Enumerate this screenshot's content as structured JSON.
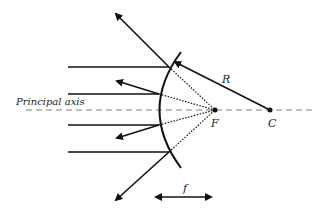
{
  "diagram": {
    "labels": {
      "principal_axis": "Principal axis",
      "focus": "F",
      "center": "C",
      "radius": "R",
      "focal_length": "f"
    },
    "colors": {
      "ink": "#111111",
      "axis": "#aaaaaa",
      "background": "#ffffff"
    }
  }
}
